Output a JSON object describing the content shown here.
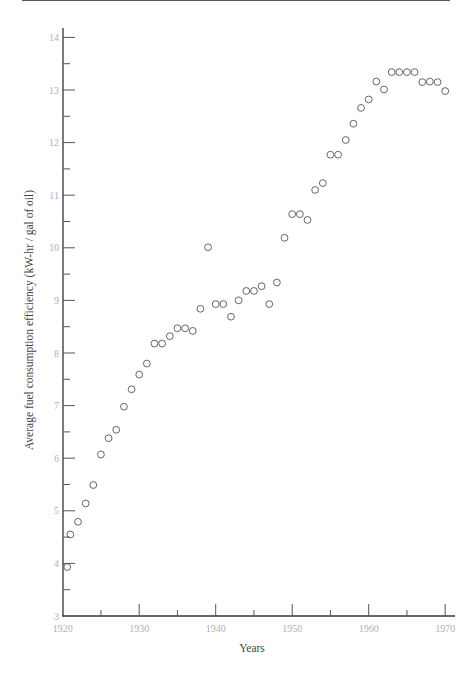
{
  "chart_data": {
    "type": "scatter",
    "title": "",
    "xlabel": "Years",
    "ylabel": "Average fuel consumption efficiency (kW-hr / gal of oil)",
    "xlim": [
      1920,
      1971
    ],
    "ylim": [
      3,
      14
    ],
    "grid": false,
    "legend": null,
    "x_ticks_major": [
      1920,
      1930,
      1940,
      1950,
      1960,
      1970
    ],
    "x_tick_labels": [
      "1920",
      "1930",
      "1940",
      "1950",
      "1960",
      "1970"
    ],
    "x_ticks_minor": [
      1925,
      1935,
      1945,
      1955,
      1965
    ],
    "y_ticks_major": [
      3,
      4,
      5,
      6,
      7,
      8,
      9,
      10,
      11,
      12,
      13,
      14
    ],
    "y_tick_labels": [
      "3",
      "4",
      "5",
      "6",
      "7",
      "8",
      "9",
      "10",
      "11",
      "12",
      "13",
      "14"
    ],
    "y_ticks_minor": [
      3.5,
      4.5,
      5.5,
      6.5,
      7.5,
      8.5,
      9.5,
      10.5,
      11.5,
      12.5,
      13.5
    ],
    "marker": "open-circle",
    "series": [
      {
        "name": "efficiency",
        "x": [
          1920.6,
          1921,
          1922,
          1923,
          1924,
          1925,
          1926,
          1927,
          1928,
          1929,
          1930,
          1931,
          1932,
          1933,
          1934,
          1935,
          1936,
          1937,
          1938,
          1939,
          1940,
          1941,
          1942,
          1943,
          1944,
          1945,
          1946,
          1947,
          1948,
          1949,
          1950,
          1951,
          1952,
          1953,
          1954,
          1955,
          1956,
          1957,
          1958,
          1959,
          1960,
          1961,
          1962,
          1963,
          1964,
          1965,
          1966,
          1967,
          1968,
          1969,
          1970
        ],
        "y": [
          3.93,
          4.55,
          4.79,
          5.14,
          5.49,
          6.07,
          6.38,
          6.54,
          6.98,
          7.31,
          7.59,
          7.8,
          8.18,
          8.18,
          8.32,
          8.47,
          8.47,
          8.42,
          8.84,
          10.01,
          8.93,
          8.93,
          8.69,
          9.0,
          9.18,
          9.18,
          9.27,
          8.93,
          9.34,
          10.19,
          10.64,
          10.64,
          10.53,
          11.1,
          11.23,
          11.77,
          11.77,
          12.05,
          12.36,
          12.66,
          12.82,
          13.16,
          13.01,
          13.34,
          13.34,
          13.34,
          13.34,
          13.15,
          13.16,
          13.15,
          12.98
        ]
      }
    ]
  },
  "layout": {
    "plot_origin_x": 62.7,
    "px_per_year": 7.65,
    "axis_y_px": 616,
    "px_per_unit": 52.6,
    "axis_left_px": 63,
    "axis_right_px": 455,
    "axis_top_px": 28
  }
}
